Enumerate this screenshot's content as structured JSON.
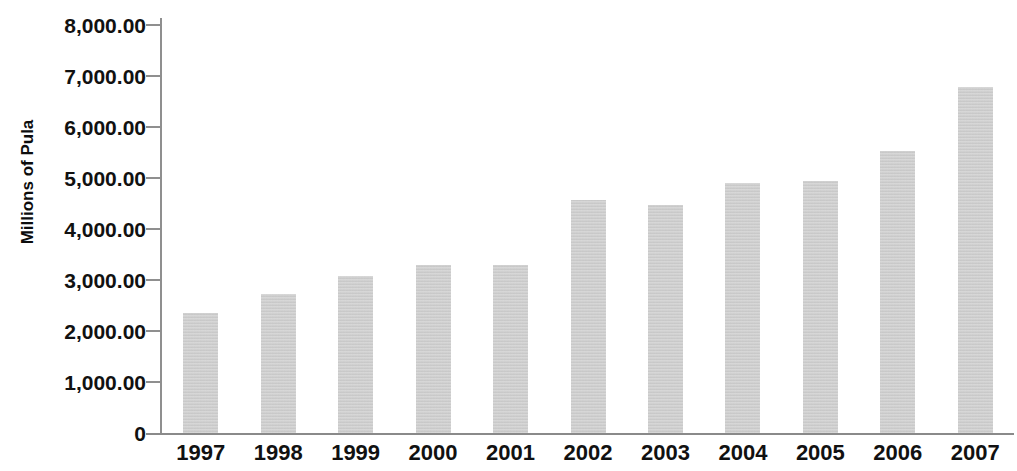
{
  "chart_data": {
    "type": "bar",
    "title": "",
    "subtitle": "",
    "xlabel": "",
    "ylabel": "Millions of Pula",
    "categories": [
      "1997",
      "1998",
      "1999",
      "2000",
      "2001",
      "2002",
      "2003",
      "2004",
      "2005",
      "2006",
      "2007"
    ],
    "values": [
      2353,
      2725,
      3078,
      3294,
      3294,
      4569,
      4471,
      4902,
      4941,
      5529,
      6784
    ],
    "series": [
      {
        "name": "Millions of Pula",
        "values": [
          2353,
          2725,
          3078,
          3294,
          3294,
          4569,
          4471,
          4902,
          4941,
          5529,
          6784
        ]
      }
    ],
    "ylim": [
      0,
      8000
    ],
    "ytick_values": [
      0,
      1000,
      2000,
      3000,
      4000,
      5000,
      6000,
      7000,
      8000
    ],
    "ytick_labels": [
      "0",
      "1,000.00",
      "2,000.00",
      "3,000.00",
      "4,000.00",
      "5,000.00",
      "6,000.00",
      "7,000.00",
      "8,000.00"
    ],
    "grid": false,
    "legend": null,
    "legend_position": "none",
    "bar_color": "#cdcdcd",
    "axis_color": "#8f8f8f",
    "text_color": "#111111",
    "background_color": "#ffffff",
    "annotations": []
  },
  "axis": {
    "y_title": "Millions of Pula"
  }
}
